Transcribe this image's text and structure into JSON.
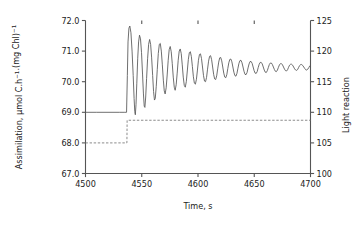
{
  "chart_data": {
    "type": "line",
    "title": "",
    "xlabel": "Time, s",
    "ylabel_left": "Assimilation, μmol C.h−1.(mg Chl)−1",
    "ylabel_right": "Light reaction",
    "xlim": [
      4500,
      4700
    ],
    "ylim_left": [
      67.0,
      72.0
    ],
    "ylim_right": [
      100,
      125
    ],
    "xticks": [
      4500,
      4550,
      4600,
      4650,
      4700
    ],
    "xticklabels": [
      "4500",
      "4550",
      "4600",
      "4650",
      "4700"
    ],
    "yticks_left": [
      67.0,
      68.0,
      69.0,
      70.0,
      71.0,
      72.0
    ],
    "yticklabels_left": [
      "67.0",
      "68.0",
      "69.0",
      "70.0",
      "71.0",
      "72.0"
    ],
    "yticks_right": [
      100,
      105,
      110,
      115,
      120,
      125
    ],
    "yticklabels_right": [
      "100",
      "105",
      "110",
      "115",
      "120",
      "125"
    ],
    "grid": false,
    "legend": "none",
    "series": [
      {
        "name": "Assimilation",
        "axis": "left",
        "style": "solid",
        "color": "#555555",
        "description": "Flat baseline at 69.0 until t=4537, then damped oscillation about a slowly rising mean settling near 70.35",
        "points": [
          [
            4500.0,
            69.0
          ],
          [
            4510.0,
            69.0
          ],
          [
            4520.0,
            69.0
          ],
          [
            4530.0,
            69.0
          ],
          [
            4535.0,
            69.0
          ],
          [
            4536.5,
            69.0
          ],
          [
            4537.2,
            70.2
          ],
          [
            4537.8,
            71.3
          ],
          [
            4538.6,
            71.75
          ],
          [
            4539.4,
            71.82
          ],
          [
            4540.4,
            71.6
          ],
          [
            4541.4,
            71.0
          ],
          [
            4542.4,
            70.2
          ],
          [
            4543.2,
            69.45
          ],
          [
            4543.8,
            69.02
          ],
          [
            4544.3,
            68.92
          ],
          [
            4544.9,
            69.25
          ],
          [
            4545.6,
            69.95
          ],
          [
            4546.4,
            70.75
          ],
          [
            4547.2,
            71.3
          ],
          [
            4548.0,
            71.52
          ],
          [
            4548.9,
            71.4
          ],
          [
            4549.8,
            70.95
          ],
          [
            4550.7,
            70.25
          ],
          [
            4551.5,
            69.6
          ],
          [
            4552.2,
            69.2
          ],
          [
            4552.8,
            69.16
          ],
          [
            4553.5,
            69.5
          ],
          [
            4554.3,
            70.1
          ],
          [
            4555.2,
            70.75
          ],
          [
            4556.1,
            71.22
          ],
          [
            4557.0,
            71.38
          ],
          [
            4557.9,
            71.22
          ],
          [
            4558.8,
            70.78
          ],
          [
            4559.7,
            70.2
          ],
          [
            4560.5,
            69.68
          ],
          [
            4561.3,
            69.4
          ],
          [
            4562.0,
            69.45
          ],
          [
            4562.9,
            69.85
          ],
          [
            4563.8,
            70.4
          ],
          [
            4564.7,
            70.92
          ],
          [
            4565.6,
            71.22
          ],
          [
            4566.5,
            71.25
          ],
          [
            4567.4,
            71.0
          ],
          [
            4568.3,
            70.55
          ],
          [
            4569.2,
            70.05
          ],
          [
            4570.0,
            69.7
          ],
          [
            4570.8,
            69.6
          ],
          [
            4571.7,
            69.8
          ],
          [
            4572.6,
            70.22
          ],
          [
            4573.5,
            70.7
          ],
          [
            4574.4,
            71.05
          ],
          [
            4575.3,
            71.15
          ],
          [
            4576.2,
            70.98
          ],
          [
            4577.1,
            70.6
          ],
          [
            4578.0,
            70.15
          ],
          [
            4578.9,
            69.82
          ],
          [
            4579.7,
            69.72
          ],
          [
            4580.6,
            69.9
          ],
          [
            4581.5,
            70.28
          ],
          [
            4582.4,
            70.7
          ],
          [
            4583.3,
            71.0
          ],
          [
            4584.2,
            71.07
          ],
          [
            4585.1,
            70.92
          ],
          [
            4586.0,
            70.55
          ],
          [
            4586.9,
            70.15
          ],
          [
            4587.8,
            69.88
          ],
          [
            4588.7,
            69.82
          ],
          [
            4589.6,
            70.0
          ],
          [
            4590.5,
            70.35
          ],
          [
            4591.4,
            70.72
          ],
          [
            4592.3,
            70.95
          ],
          [
            4593.2,
            70.98
          ],
          [
            4594.1,
            70.82
          ],
          [
            4595.0,
            70.5
          ],
          [
            4595.9,
            70.16
          ],
          [
            4596.8,
            69.95
          ],
          [
            4597.7,
            69.92
          ],
          [
            4598.6,
            70.08
          ],
          [
            4599.5,
            70.38
          ],
          [
            4600.4,
            70.7
          ],
          [
            4601.3,
            70.89
          ],
          [
            4602.2,
            70.91
          ],
          [
            4603.1,
            70.76
          ],
          [
            4604.0,
            70.48
          ],
          [
            4604.9,
            70.2
          ],
          [
            4605.8,
            70.02
          ],
          [
            4606.7,
            70.0
          ],
          [
            4607.6,
            70.14
          ],
          [
            4608.5,
            70.41
          ],
          [
            4609.4,
            70.67
          ],
          [
            4610.3,
            70.83
          ],
          [
            4611.2,
            70.85
          ],
          [
            4612.1,
            70.72
          ],
          [
            4613.0,
            70.48
          ],
          [
            4613.9,
            70.24
          ],
          [
            4614.8,
            70.09
          ],
          [
            4615.7,
            70.07
          ],
          [
            4616.6,
            70.19
          ],
          [
            4617.5,
            70.42
          ],
          [
            4618.4,
            70.64
          ],
          [
            4619.3,
            70.78
          ],
          [
            4620.2,
            70.79
          ],
          [
            4621.1,
            70.68
          ],
          [
            4622.0,
            70.48
          ],
          [
            4622.9,
            70.28
          ],
          [
            4623.8,
            70.15
          ],
          [
            4624.7,
            70.13
          ],
          [
            4625.6,
            70.23
          ],
          [
            4626.5,
            70.43
          ],
          [
            4627.4,
            70.62
          ],
          [
            4628.3,
            70.73
          ],
          [
            4629.2,
            70.74
          ],
          [
            4630.1,
            70.65
          ],
          [
            4631.0,
            70.48
          ],
          [
            4631.9,
            70.31
          ],
          [
            4632.8,
            70.2
          ],
          [
            4633.7,
            70.18
          ],
          [
            4634.6,
            70.27
          ],
          [
            4635.5,
            70.44
          ],
          [
            4636.4,
            70.6
          ],
          [
            4637.3,
            70.69
          ],
          [
            4638.2,
            70.7
          ],
          [
            4639.1,
            70.62
          ],
          [
            4640.0,
            70.48
          ],
          [
            4640.9,
            70.34
          ],
          [
            4641.8,
            70.24
          ],
          [
            4642.7,
            70.23
          ],
          [
            4643.6,
            70.3
          ],
          [
            4644.5,
            70.45
          ],
          [
            4645.4,
            70.58
          ],
          [
            4646.3,
            70.66
          ],
          [
            4647.2,
            70.66
          ],
          [
            4648.1,
            70.6
          ],
          [
            4649.0,
            70.48
          ],
          [
            4649.9,
            70.36
          ],
          [
            4650.8,
            70.28
          ],
          [
            4651.7,
            70.27
          ],
          [
            4652.6,
            70.33
          ],
          [
            4653.5,
            70.46
          ],
          [
            4654.4,
            70.57
          ],
          [
            4655.3,
            70.63
          ],
          [
            4656.2,
            70.63
          ],
          [
            4657.1,
            70.58
          ],
          [
            4658.0,
            70.48
          ],
          [
            4658.9,
            70.38
          ],
          [
            4659.8,
            70.31
          ],
          [
            4660.7,
            70.3
          ],
          [
            4661.6,
            70.36
          ],
          [
            4662.5,
            70.46
          ],
          [
            4663.4,
            70.56
          ],
          [
            4664.3,
            70.61
          ],
          [
            4665.2,
            70.61
          ],
          [
            4666.1,
            70.56
          ],
          [
            4667.0,
            70.48
          ],
          [
            4667.9,
            70.4
          ],
          [
            4668.8,
            70.34
          ],
          [
            4669.7,
            70.33
          ],
          [
            4670.6,
            70.38
          ],
          [
            4671.5,
            70.47
          ],
          [
            4672.4,
            70.55
          ],
          [
            4673.3,
            70.59
          ],
          [
            4674.2,
            70.59
          ],
          [
            4675.1,
            70.55
          ],
          [
            4676.0,
            70.48
          ],
          [
            4676.9,
            70.41
          ],
          [
            4677.8,
            70.36
          ],
          [
            4678.7,
            70.35
          ],
          [
            4679.6,
            70.39
          ],
          [
            4680.5,
            70.47
          ],
          [
            4681.4,
            70.54
          ],
          [
            4682.3,
            70.57
          ],
          [
            4683.2,
            70.57
          ],
          [
            4684.1,
            70.54
          ],
          [
            4685.0,
            70.48
          ],
          [
            4685.9,
            70.42
          ],
          [
            4686.8,
            70.38
          ],
          [
            4687.7,
            70.37
          ],
          [
            4688.6,
            70.4
          ],
          [
            4689.5,
            70.47
          ],
          [
            4690.4,
            70.53
          ],
          [
            4691.3,
            70.56
          ],
          [
            4692.2,
            70.56
          ],
          [
            4693.1,
            70.53
          ],
          [
            4694.0,
            70.48
          ],
          [
            4694.9,
            70.43
          ],
          [
            4695.8,
            70.39
          ],
          [
            4696.7,
            70.38
          ],
          [
            4697.6,
            70.41
          ],
          [
            4698.5,
            70.46
          ],
          [
            4699.4,
            70.52
          ],
          [
            4700.0,
            70.54
          ]
        ]
      },
      {
        "name": "Light reaction",
        "axis": "right",
        "style": "dashed",
        "color": "#777777",
        "description": "Step increase from 105.0 to 108.7 at t=4537",
        "points": [
          [
            4500.0,
            105.0
          ],
          [
            4536.8,
            105.0
          ],
          [
            4537.0,
            108.7
          ],
          [
            4700.0,
            108.7
          ]
        ]
      }
    ]
  }
}
